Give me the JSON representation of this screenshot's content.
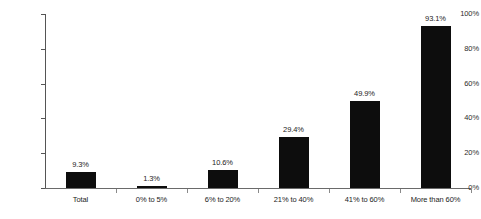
{
  "chart_data": {
    "type": "bar",
    "title": "",
    "subtitle": "",
    "xlabel": "",
    "ylabel": "",
    "categories": [
      "Total",
      "0% to 5%",
      "6% to 20%",
      "21% to 40%",
      "41% to 60%",
      "More than 60%"
    ],
    "values": [
      9.3,
      1.3,
      10.6,
      29.4,
      49.9,
      93.1
    ],
    "value_labels": [
      "9.3%",
      "1.3%",
      "10.6%",
      "29.4%",
      "49.9%",
      "93.1%"
    ],
    "ylim": [
      0,
      100
    ],
    "ytick_values": [
      0,
      20,
      40,
      60,
      80,
      100
    ],
    "ytick_labels": [
      "0%",
      "20%",
      "40%",
      "60%",
      "80%",
      "100%"
    ],
    "grid": false,
    "legend": false,
    "legend_position": "none",
    "bar_color": "#0d0d0d",
    "axis_color": "#555555",
    "text_color": "#232323",
    "background_color": "#ffffff"
  }
}
